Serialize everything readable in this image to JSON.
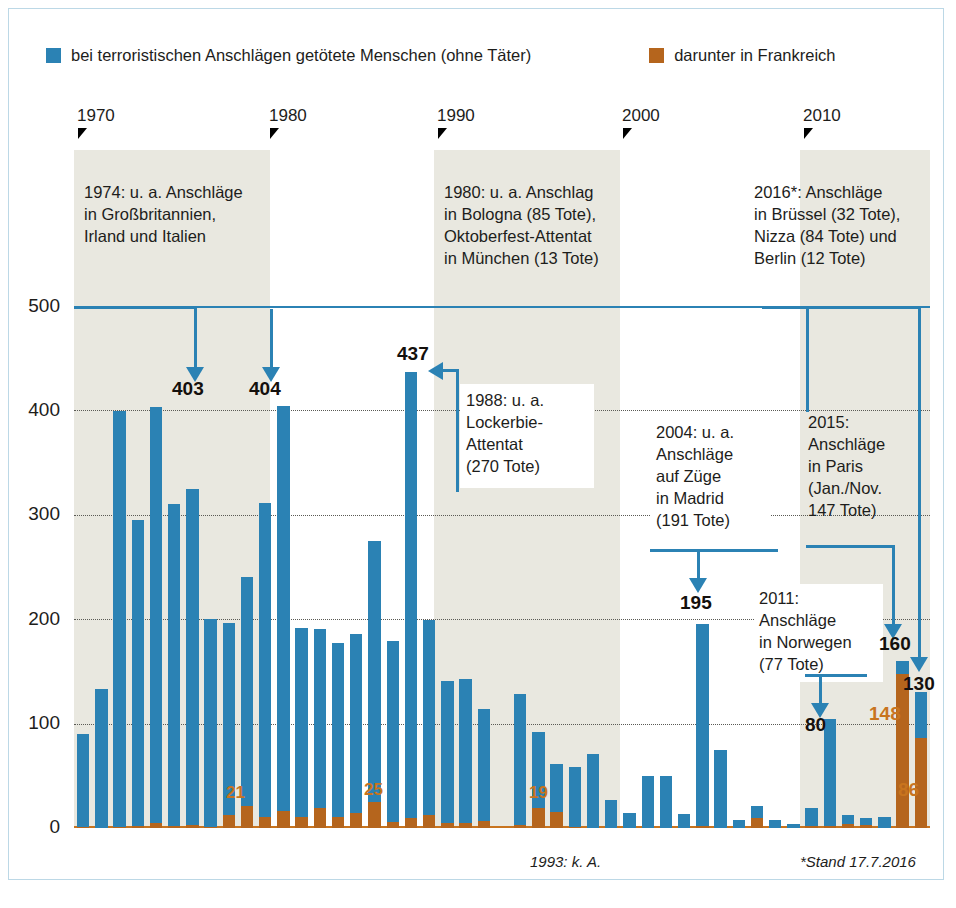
{
  "legend": {
    "items": [
      {
        "label": "bei terroristischen Anschlägen getötete Menschen (ohne Täter)",
        "color": "#2b82b4",
        "icon": "legend-swatch-blue"
      },
      {
        "label": "darunter in Frankreich",
        "color": "#b5651d",
        "icon": "legend-swatch-orange"
      }
    ]
  },
  "axis": {
    "year_ticks": [
      "1970",
      "1980",
      "1990",
      "2000",
      "2010"
    ],
    "y_ticks": [
      "500",
      "400",
      "300",
      "200",
      "100",
      "0"
    ]
  },
  "callouts": {
    "c1974": "1974: u. a. Anschläge\nin Großbritannien,\nIrland und Italien",
    "c1980": "1980: u. a. Anschlag\nin Bologna (85 Tote),\nOktoberfest-Attentat\nin München (13 Tote)",
    "c2016": "2016*: Anschläge\nin Brüssel (32 Tote),\nNizza (84 Tote) und\nBerlin (12 Tote)",
    "c1988": "1988: u. a.\nLockerbie-\nAttentat\n(270 Tote)",
    "c2004": "2004: u. a.\nAnschläge\nauf Züge\nin Madrid\n(191 Tote)",
    "c2015": "2015:\nAnschläge\nin Paris\n(Jan./Nov.\n147 Tote)",
    "c2011": "2011:\nAnschläge\nin Norwegen\n(77 Tote)"
  },
  "value_labels": {
    "v1974": "403",
    "v1980": "404",
    "v1988": "437",
    "v2004": "195",
    "v2011": "80",
    "v2015": "160",
    "v2016": "130",
    "fr1979": "21",
    "fr1986": "25",
    "fr1995": "19",
    "fr2015": "148",
    "fr2016": "86"
  },
  "footnotes": {
    "left": "1993: k. A.",
    "right": "*Stand 17.7.2016"
  },
  "colors": {
    "blue": "#2b82b4",
    "orange": "#b5651d",
    "orange_text": "#c8741e",
    "era_shade": "#e9e8e0",
    "frame": "#bcd8e6",
    "text": "#1d1d1b"
  },
  "chart_data": {
    "type": "bar",
    "title": "",
    "xlabel": "",
    "ylabel": "",
    "ylim": [
      0,
      500
    ],
    "grid": true,
    "legend_position": "top",
    "stacked": true,
    "categories": [
      "1970",
      "1971",
      "1972",
      "1973",
      "1974",
      "1975",
      "1976",
      "1977",
      "1978",
      "1979",
      "1980",
      "1981",
      "1982",
      "1983",
      "1984",
      "1985",
      "1986",
      "1987",
      "1988",
      "1989",
      "1990",
      "1991",
      "1992",
      "1993",
      "1994",
      "1995",
      "1996",
      "1997",
      "1998",
      "1999",
      "2000",
      "2001",
      "2002",
      "2003",
      "2004",
      "2005",
      "2006",
      "2007",
      "2008",
      "2009",
      "2010",
      "2011",
      "2012",
      "2013",
      "2014",
      "2015",
      "2016"
    ],
    "series": [
      {
        "name": "bei terroristischen Anschlägen getötete Menschen (ohne Täter)",
        "color": "#2b82b4",
        "values": [
          90,
          133,
          399,
          295,
          403,
          310,
          325,
          200,
          196,
          240,
          311,
          404,
          192,
          191,
          177,
          186,
          275,
          179,
          437,
          199,
          141,
          143,
          114,
          null,
          128,
          92,
          61,
          58,
          71,
          27,
          14,
          50,
          50,
          13,
          195,
          75,
          8,
          21,
          8,
          4,
          19,
          104,
          12,
          10,
          11,
          160,
          130
        ]
      },
      {
        "name": "darunter in Frankreich",
        "color": "#b5651d",
        "values": [
          1,
          0,
          1,
          2,
          5,
          2,
          3,
          1,
          12,
          21,
          11,
          16,
          11,
          19,
          11,
          14,
          25,
          6,
          10,
          12,
          5,
          5,
          7,
          null,
          3,
          19,
          15,
          1,
          0,
          0,
          0,
          0,
          0,
          0,
          2,
          0,
          0,
          10,
          0,
          0,
          2,
          2,
          4,
          3,
          0,
          148,
          86
        ]
      }
    ],
    "annotations": [
      {
        "year": "1974",
        "label": "403",
        "text": "1974: u. a. Anschläge in Großbritannien, Irland und Italien"
      },
      {
        "year": "1980",
        "label": "404",
        "text": "1980: u. a. Anschlag in Bologna (85 Tote), Oktoberfest-Attentat in München (13 Tote)"
      },
      {
        "year": "1988",
        "label": "437",
        "text": "1988: u. a. Lockerbie-Attentat (270 Tote)"
      },
      {
        "year": "2004",
        "label": "195",
        "text": "2004: u. a. Anschläge auf Züge in Madrid (191 Tote)"
      },
      {
        "year": "2011",
        "label": "80",
        "text": "2011: Anschläge in Norwegen (77 Tote)"
      },
      {
        "year": "2015",
        "label": "160",
        "text": "2015: Anschläge in Paris (Jan./Nov. 147 Tote)"
      },
      {
        "year": "2016",
        "label": "130",
        "text": "2016*: Anschläge in Brüssel (32 Tote), Nizza (84 Tote) und Berlin (12 Tote)"
      }
    ],
    "notes": [
      "1993: k. A.",
      "*Stand 17.7.2016"
    ]
  }
}
